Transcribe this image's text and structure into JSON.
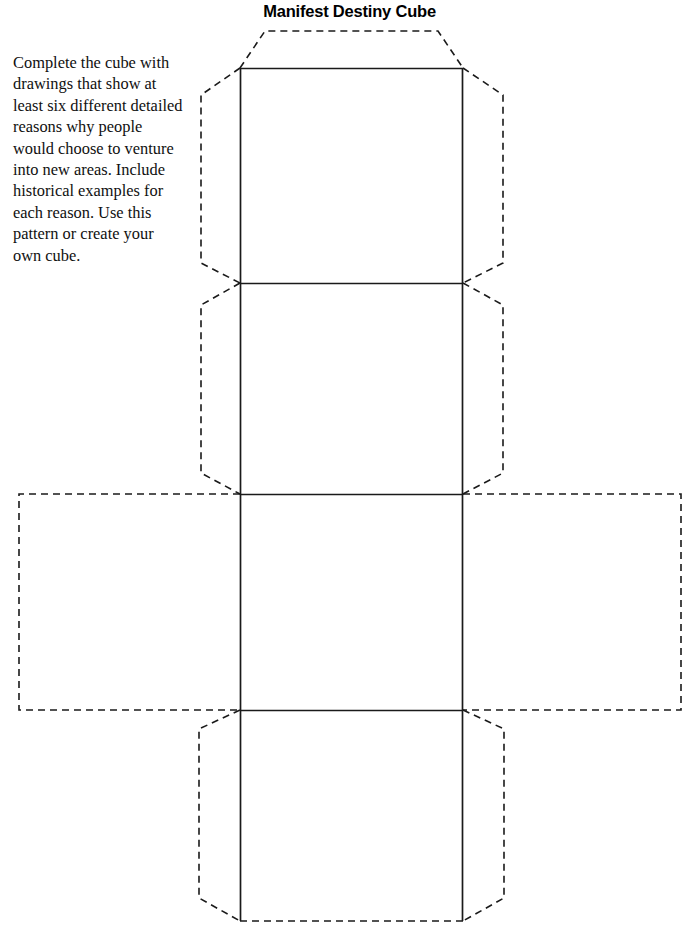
{
  "page": {
    "title": "Manifest Destiny Cube",
    "background_color": "#ffffff",
    "ink_color": "#000000",
    "width": 699,
    "height": 935
  },
  "instructions": {
    "text": "Complete the cube with drawings that show at least six different detailed reasons why people would choose to venture into new areas. Include historical examples for each reason. Use this pattern or create your own cube."
  },
  "diagram": {
    "name": "cube-net-template",
    "solid_line_color": "#1a1a1a",
    "dashed_line_color": "#1a1a1a",
    "faces": [
      {
        "id": "face-top",
        "label": "",
        "x": 240,
        "y": 68,
        "width": 223,
        "height": 215
      },
      {
        "id": "face-front",
        "label": "",
        "x": 240,
        "y": 283,
        "width": 223,
        "height": 211
      },
      {
        "id": "face-center",
        "label": "",
        "x": 240,
        "y": 494,
        "width": 223,
        "height": 216
      },
      {
        "id": "face-bottom",
        "label": "",
        "x": 240,
        "y": 710,
        "width": 223,
        "height": 211
      },
      {
        "id": "face-left",
        "label": "",
        "x": 19,
        "y": 494,
        "width": 221,
        "height": 216
      },
      {
        "id": "face-right",
        "label": "",
        "x": 463,
        "y": 494,
        "width": 218,
        "height": 216
      }
    ],
    "flaps": [
      {
        "id": "flap-top",
        "position": "top"
      },
      {
        "id": "flap-upper-left",
        "position": "left"
      },
      {
        "id": "flap-upper-right",
        "position": "right"
      },
      {
        "id": "flap-middle-left",
        "position": "left"
      },
      {
        "id": "flap-middle-right",
        "position": "right"
      },
      {
        "id": "flap-lower-left",
        "position": "left"
      },
      {
        "id": "flap-lower-right",
        "position": "right"
      }
    ]
  }
}
